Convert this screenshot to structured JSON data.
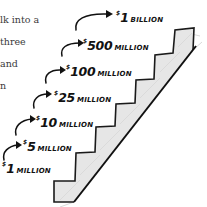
{
  "body_text": {
    "lines": [
      "lk into a",
      "three",
      "and",
      "n"
    ]
  },
  "staircase": {
    "fill_color": "#e6e6e6",
    "stroke_color": "#1a1a1a",
    "levels": [
      {
        "currency": "$",
        "amount": "1",
        "unit": "MILLION"
      },
      {
        "currency": "$",
        "amount": "5",
        "unit": "MILLION"
      },
      {
        "currency": "$",
        "amount": "10",
        "unit": "MILLION"
      },
      {
        "currency": "$",
        "amount": "25",
        "unit": "MILLION"
      },
      {
        "currency": "$",
        "amount": "100",
        "unit": "MILLION"
      },
      {
        "currency": "$",
        "amount": "500",
        "unit": "MILLION"
      },
      {
        "currency": "$",
        "amount": "1",
        "unit": "BILLION"
      }
    ]
  }
}
